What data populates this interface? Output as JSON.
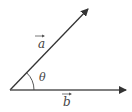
{
  "diagram": {
    "type": "vector-angle",
    "colors": {
      "line": "#333333",
      "text": "#444444",
      "background": "#ffffff"
    },
    "origin": {
      "x": 10,
      "y": 90
    },
    "vectors": [
      {
        "id": "a",
        "label": "a",
        "tip": {
          "x": 88,
          "y": 9
        },
        "label_pos": {
          "x": 38,
          "y": 48
        }
      },
      {
        "id": "b",
        "label": "b",
        "tip": {
          "x": 126,
          "y": 90
        },
        "label_pos": {
          "x": 65,
          "y": 106
        }
      }
    ],
    "angle": {
      "label": "θ",
      "arc_radius": 24,
      "label_pos": {
        "x": 41,
        "y": 81
      }
    }
  }
}
